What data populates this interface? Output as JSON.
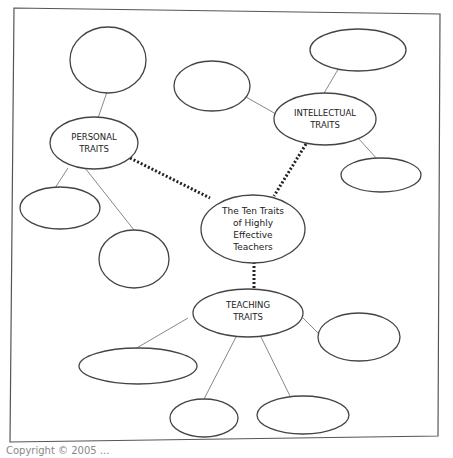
{
  "diagram": {
    "type": "concept-map",
    "center": {
      "lines": [
        "The Ten Traits",
        "of Highly",
        "Effective",
        "Teachers"
      ]
    },
    "categories": [
      {
        "id": "personal",
        "lines": [
          "PERSONAL",
          "TRAITS"
        ],
        "blank_nodes": 4
      },
      {
        "id": "intellectual",
        "lines": [
          "INTELLECTUAL",
          "TRAITS"
        ],
        "blank_nodes": 3
      },
      {
        "id": "teaching",
        "lines": [
          "TEACHING",
          "TRAITS"
        ],
        "blank_nodes": 5
      }
    ],
    "colors": {
      "stroke": "#444444",
      "connector": "#888888",
      "dotted": "#222222",
      "border": "#555555"
    }
  },
  "footer": {
    "text": "Copyright © 2005 ..."
  }
}
